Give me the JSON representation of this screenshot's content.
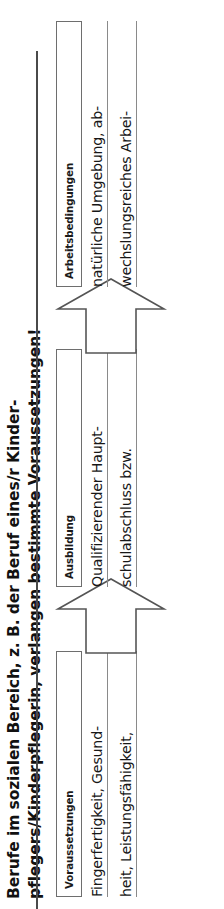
{
  "document": {
    "title_lines": [
      "Berufe im sozialen Bereich, z. B. der Beruf eines/r Kinder-",
      "pflegers/Kinderpflegerin, verlangen bestimmte Voraussetzungen!"
    ],
    "rule_color": "#4a4a4a"
  },
  "diagram": {
    "type": "process-flow",
    "arrow_icon": "arrow-right-icon",
    "columns": [
      {
        "header": "Voraussetzungen",
        "body_lines": [
          "Fingerfertigkeit, Gesund-",
          "heit, Leistungsfähigkeit,"
        ]
      },
      {
        "header": "Ausbildung",
        "body_lines": [
          "Qualifizierender Haupt-",
          "schulabschluss bzw."
        ]
      },
      {
        "header": "Arbeitsbedingungen",
        "body_lines": [
          "natürliche Umgebung, ab-",
          "wechslungsreiches Arbei-"
        ]
      }
    ]
  },
  "colors": {
    "text": "#171717",
    "box_border": "#6e6e6e",
    "arrow_stroke": "#555555",
    "underline": "#8a8a8a",
    "background": "#ffffff"
  }
}
